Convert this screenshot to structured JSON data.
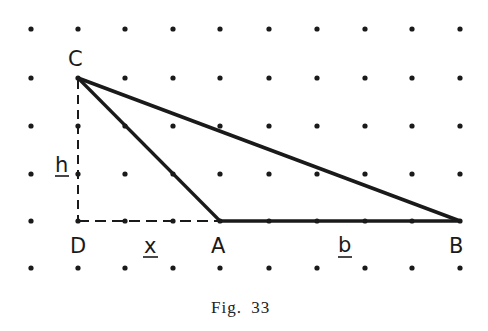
{
  "figure": {
    "caption_prefix": "Fig.",
    "caption_number": "33",
    "grid": {
      "columns_x": [
        31,
        78,
        125,
        173,
        220,
        269,
        317,
        365,
        412,
        460
      ],
      "rows_y": [
        29,
        78,
        126,
        174,
        221,
        268
      ],
      "dot_color": "#1a1a1a"
    },
    "points": {
      "C": {
        "label": "C",
        "x": 78,
        "y": 78
      },
      "D": {
        "label": "D",
        "x": 78,
        "y": 221
      },
      "A": {
        "label": "A",
        "x": 220,
        "y": 221
      },
      "B": {
        "label": "B",
        "x": 460,
        "y": 221
      }
    },
    "segments": [
      {
        "from": "C",
        "to": "A",
        "style": "solid"
      },
      {
        "from": "C",
        "to": "B",
        "style": "solid"
      },
      {
        "from": "A",
        "to": "B",
        "style": "solid"
      },
      {
        "from": "C",
        "to": "D",
        "style": "dashed"
      },
      {
        "from": "D",
        "to": "A",
        "style": "dashed"
      }
    ],
    "measure_labels": {
      "h": "h",
      "x": "x",
      "b": "b"
    },
    "vertex_labels": {
      "C": "C",
      "D": "D",
      "A": "A",
      "B": "B"
    }
  }
}
